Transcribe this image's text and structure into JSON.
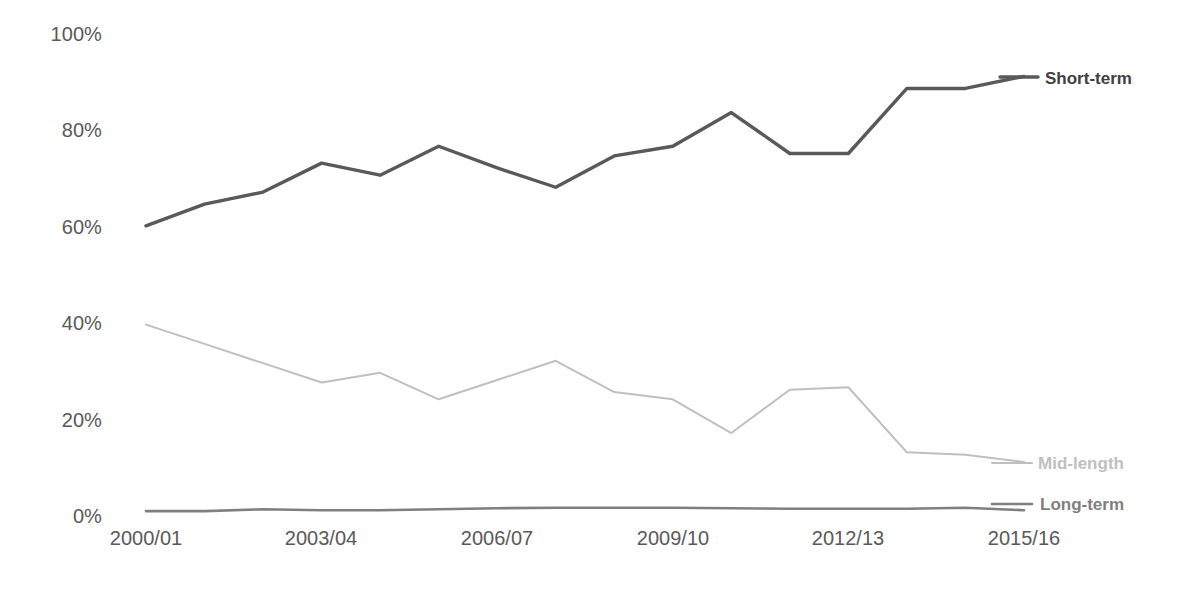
{
  "chart_data": {
    "type": "line",
    "title": "",
    "subtitle": "",
    "xlabel": "",
    "ylabel": "",
    "grid": false,
    "legend_position": "direct-labels-right",
    "ylim": [
      0,
      100
    ],
    "ytick_labels": [
      "100%",
      "80%",
      "60%",
      "40%",
      "20%",
      "0%"
    ],
    "ytick_values": [
      100,
      80,
      60,
      40,
      20,
      0
    ],
    "x": [
      "2000/01",
      "2001/02",
      "2002/03",
      "2003/04",
      "2004/05",
      "2005/06",
      "2006/07",
      "2007/08",
      "2008/09",
      "2009/10",
      "2010/11",
      "2011/12",
      "2012/13",
      "2013/14",
      "2014/15",
      "2015/16"
    ],
    "xtick_labels": [
      "2000/01",
      "2003/04",
      "2006/07",
      "2009/10",
      "2012/13",
      "2015/16"
    ],
    "xtick_indices": [
      0,
      3,
      6,
      9,
      12,
      15
    ],
    "series": [
      {
        "name": "Short-term",
        "color": "#595959",
        "values": [
          60,
          64.5,
          67,
          73,
          70.5,
          76.5,
          72,
          68,
          74.5,
          76.5,
          83.5,
          75,
          75,
          88.5,
          88.5,
          91
        ]
      },
      {
        "name": "Mid-length",
        "color": "#bfbfbf",
        "values": [
          39.5,
          35.5,
          31.5,
          27.5,
          29.5,
          24,
          28,
          32,
          25.5,
          24,
          17,
          26,
          26.5,
          13,
          12.5,
          11
        ]
      },
      {
        "name": "Long-term",
        "color": "#7f7f7f",
        "values": [
          0.8,
          0.8,
          1.2,
          1,
          1,
          1.2,
          1.4,
          1.5,
          1.5,
          1.5,
          1.4,
          1.3,
          1.3,
          1.3,
          1.5,
          1
        ]
      }
    ]
  },
  "labels": {
    "short_term": "Short-term",
    "mid_length": "Mid-length",
    "long_term": "Long-term"
  }
}
